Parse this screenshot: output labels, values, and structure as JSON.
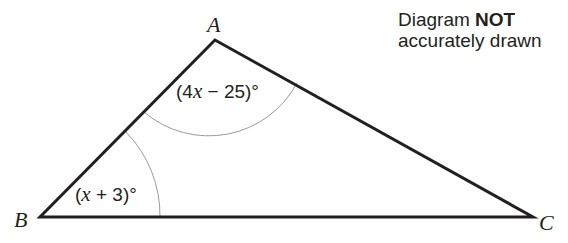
{
  "diagram": {
    "type": "triangle",
    "vertices": [
      {
        "label": "A",
        "x": 215,
        "y": 40
      },
      {
        "label": "B",
        "x": 40,
        "y": 217
      },
      {
        "label": "C",
        "x": 533,
        "y": 217
      }
    ],
    "angles": [
      {
        "at": "A",
        "prefix": "(4",
        "var": "x",
        "suffix": " − 25)°"
      },
      {
        "at": "B",
        "prefix": "(",
        "var": "x",
        "suffix": " + 3)°"
      }
    ],
    "note": {
      "line1_plain": "Diagram ",
      "line1_bold": "NOT",
      "line2": "accurately drawn"
    },
    "colors": {
      "line": "#231f20",
      "arc": "#9a9a9a"
    }
  }
}
